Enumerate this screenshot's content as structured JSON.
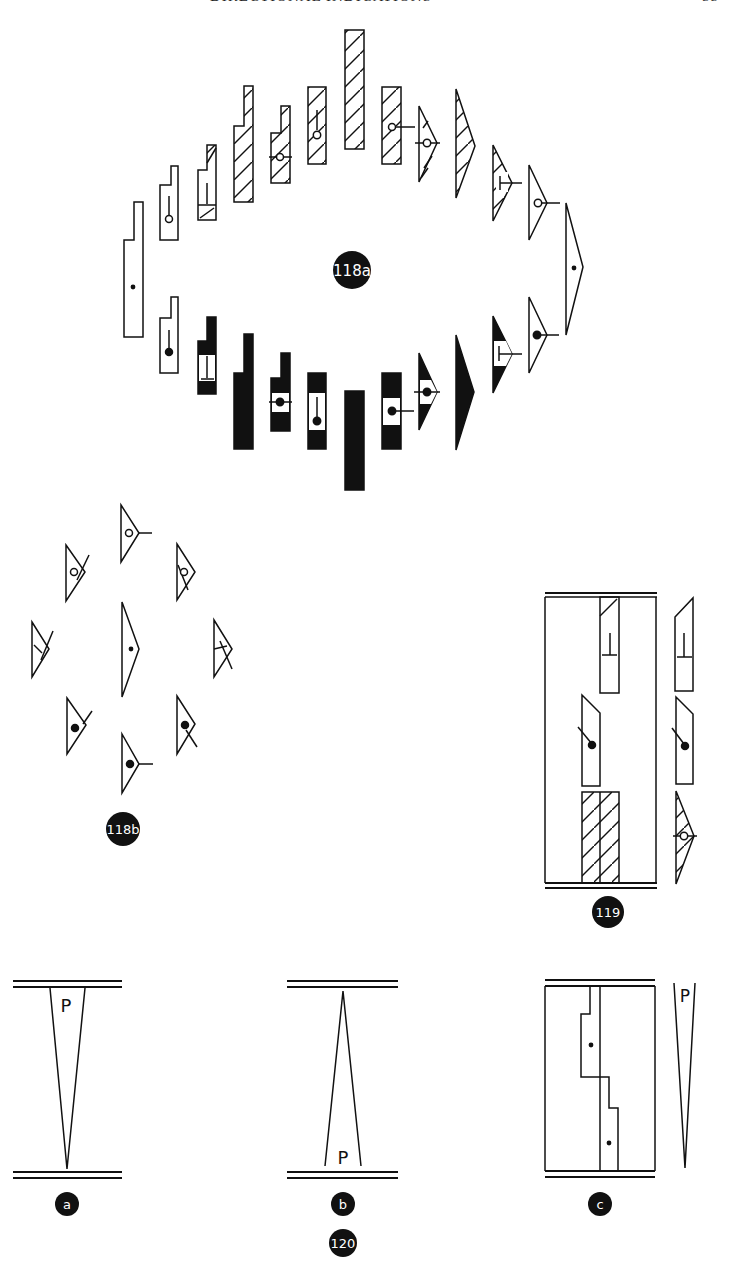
{
  "page": {
    "running_header": "DIRECTIONAL INDICATIONS",
    "page_number": "55"
  },
  "figures": {
    "fig118a": {
      "label": "118a"
    },
    "fig118b": {
      "label": "118b"
    },
    "fig119": {
      "label": "119"
    },
    "fig120": {
      "label": "120",
      "sub_a": {
        "label": "a",
        "letter": "P"
      },
      "sub_b": {
        "label": "b",
        "letter": "P"
      },
      "sub_c": {
        "label": "c",
        "letter": "P"
      }
    }
  },
  "colors": {
    "ink": "#111111",
    "paper": "#ffffff"
  }
}
